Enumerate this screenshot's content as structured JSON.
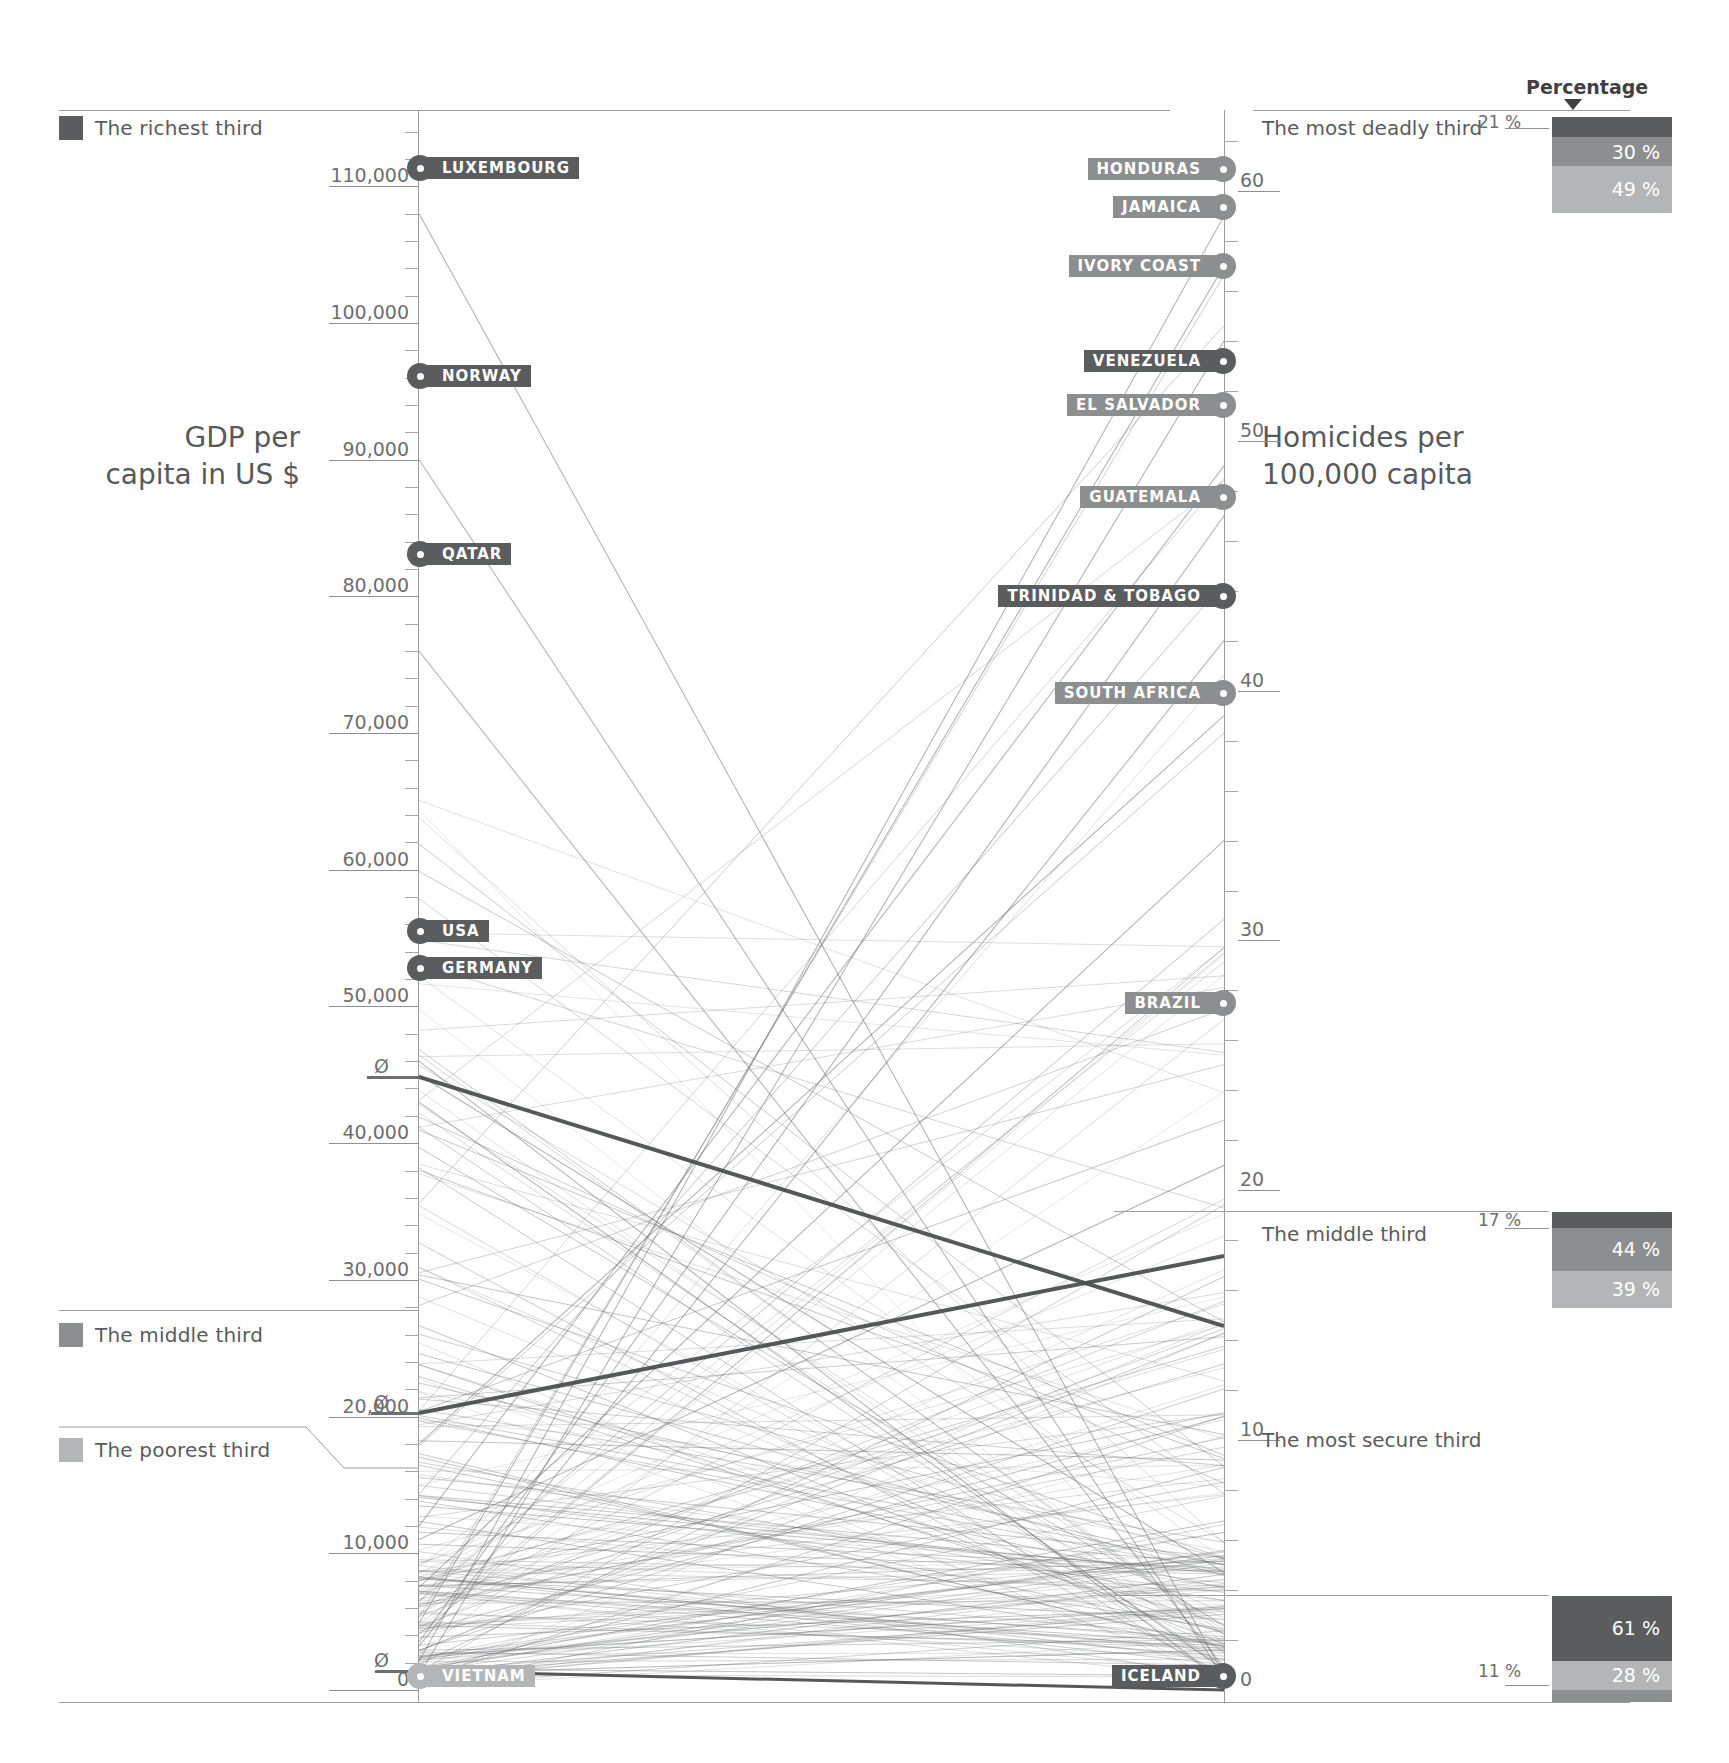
{
  "legend": {
    "items": [
      {
        "name": "richest-third",
        "label": "The richest third",
        "color": "#5b5c5e"
      },
      {
        "name": "middle-third",
        "label": "The middle third",
        "color": "#8d8e90"
      },
      {
        "name": "poorest-third",
        "label": "The poorest third",
        "color": "#b4b5b7"
      }
    ]
  },
  "axes": {
    "left": {
      "title_line1": "GDP per",
      "title_line2": "capita in US $",
      "ticks": [
        "110,000",
        "100,000",
        "90,000",
        "80,000",
        "70,000",
        "60,000",
        "50,000",
        "40,000",
        "30,000",
        "20,000",
        "10,000",
        "0"
      ],
      "avg_marks": [
        "Ø",
        "Ø",
        "Ø"
      ]
    },
    "right": {
      "title_line1": "Homicides per",
      "title_line2": "100,000 capita",
      "ticks": [
        "60",
        "50",
        "40",
        "30",
        "20",
        "10",
        "0"
      ]
    }
  },
  "percentage_header": {
    "label": "Percentage",
    "arrow": "down-triangle"
  },
  "panels": [
    {
      "name": "most-deadly-third",
      "title": "The most deadly third",
      "outside_label": "21 %",
      "segments": [
        {
          "value": "21 %",
          "pct": 21,
          "color": "#5b5c5e",
          "show_label": false
        },
        {
          "value": "30 %",
          "pct": 30,
          "color": "#8d8e90",
          "show_label": true
        },
        {
          "value": "49 %",
          "pct": 49,
          "color": "#b4b5b7",
          "show_label": true
        }
      ]
    },
    {
      "name": "middle-third",
      "title": "The middle third",
      "outside_label": "17 %",
      "segments": [
        {
          "value": "17 %",
          "pct": 17,
          "color": "#5b5c5e",
          "show_label": false
        },
        {
          "value": "44 %",
          "pct": 44,
          "color": "#8d8e90",
          "show_label": true
        },
        {
          "value": "39 %",
          "pct": 39,
          "color": "#b4b5b7",
          "show_label": true
        }
      ]
    },
    {
      "name": "most-secure-third",
      "title": "The most secure third",
      "outside_label": "11 %",
      "segments": [
        {
          "value": "61 %",
          "pct": 61,
          "color": "#5b5c5e",
          "show_label": true
        },
        {
          "value": "28 %",
          "pct": 28,
          "color": "#b4b5b7",
          "show_label": true
        },
        {
          "value": "11 %",
          "pct": 11,
          "color": "#8d8e90",
          "show_label": false
        }
      ]
    }
  ],
  "left_countries": [
    {
      "name": "luxembourg",
      "label": "LUXEMBOURG",
      "tier": "richest",
      "y": 168
    },
    {
      "name": "norway",
      "label": "NORWAY",
      "tier": "richest",
      "y": 376
    },
    {
      "name": "qatar",
      "label": "QATAR",
      "tier": "richest",
      "y": 554
    },
    {
      "name": "usa",
      "label": "USA",
      "tier": "richest",
      "y": 931
    },
    {
      "name": "germany",
      "label": "GERMANY",
      "tier": "richest",
      "y": 968
    },
    {
      "name": "vietnam",
      "label": "VIETNAM",
      "tier": "poorest",
      "y": 1676
    }
  ],
  "right_countries": [
    {
      "name": "honduras",
      "label": "HONDURAS",
      "tier": "middle",
      "y": 169
    },
    {
      "name": "jamaica",
      "label": "JAMAICA",
      "tier": "middle",
      "y": 207
    },
    {
      "name": "ivory-coast",
      "label": "IVORY COAST",
      "tier": "middle",
      "y": 266
    },
    {
      "name": "venezuela",
      "label": "VENEZUELA",
      "tier": "richest",
      "y": 361
    },
    {
      "name": "el-salvador",
      "label": "EL SALVADOR",
      "tier": "middle",
      "y": 405
    },
    {
      "name": "guatemala",
      "label": "GUATEMALA",
      "tier": "middle",
      "y": 497
    },
    {
      "name": "trinidad-tobago",
      "label": "TRINIDAD & TOBAGO",
      "tier": "richest",
      "y": 596
    },
    {
      "name": "south-africa",
      "label": "SOUTH AFRICA",
      "tier": "middle",
      "y": 693
    },
    {
      "name": "brazil",
      "label": "BRAZIL",
      "tier": "middle",
      "y": 1003
    },
    {
      "name": "iceland",
      "label": "ICELAND",
      "tier": "richest",
      "y": 1676
    }
  ],
  "chart_data": {
    "type": "line",
    "subtype": "slopegraph / parallel-coordinates",
    "left_axis": {
      "label": "GDP per capita in US $",
      "ticks": [
        110000,
        100000,
        90000,
        80000,
        70000,
        60000,
        50000,
        40000,
        30000,
        20000,
        10000,
        0
      ],
      "range": [
        0,
        115000
      ],
      "tier_averages": {
        "richest": 33000,
        "middle": 4800,
        "poorest": 1200
      }
    },
    "right_axis": {
      "label": "Homicides per 100,000 capita",
      "ticks": [
        60,
        50,
        40,
        30,
        20,
        10,
        0
      ],
      "range": [
        0,
        63
      ],
      "tier_averages": {
        "richest": 2.5,
        "middle": 9.0,
        "poorest": 13.0
      }
    },
    "grid": false,
    "legend_position": "left",
    "series": [
      {
        "name": "LUXEMBOURG",
        "tier": "richest",
        "gdp": 108000,
        "homicides": 0.6
      },
      {
        "name": "NORWAY",
        "tier": "richest",
        "gdp": 90000,
        "homicides": 0.5
      },
      {
        "name": "QATAR",
        "tier": "richest",
        "gdp": 76000,
        "homicides": 0.9
      },
      {
        "name": "USA",
        "tier": "richest",
        "gdp": 45000,
        "homicides": 4.7
      },
      {
        "name": "GERMANY",
        "tier": "richest",
        "gdp": 43000,
        "homicides": 0.8
      },
      {
        "name": "VIETNAM",
        "tier": "poorest",
        "gdp": 1200,
        "homicides": 1.6
      },
      {
        "name": "HONDURAS",
        "tier": "middle",
        "gdp": 2100,
        "homicides": 59
      },
      {
        "name": "JAMAICA",
        "tier": "middle",
        "gdp": 4900,
        "homicides": 57
      },
      {
        "name": "IVORY COAST",
        "tier": "middle",
        "gdp": 1100,
        "homicides": 54
      },
      {
        "name": "VENEZUELA",
        "tier": "richest",
        "gdp": 12000,
        "homicides": 49
      },
      {
        "name": "EL SALVADOR",
        "tier": "middle",
        "gdp": 3500,
        "homicides": 47
      },
      {
        "name": "GUATEMALA",
        "tier": "middle",
        "gdp": 3200,
        "homicides": 42
      },
      {
        "name": "TRINIDAD & TOBAGO",
        "tier": "richest",
        "gdp": 18000,
        "homicides": 39
      },
      {
        "name": "SOUTH AFRICA",
        "tier": "middle",
        "gdp": 7500,
        "homicides": 34
      },
      {
        "name": "BRAZIL",
        "tier": "middle",
        "gdp": 11000,
        "homicides": 21
      },
      {
        "name": "ICELAND",
        "tier": "richest",
        "gdp": 46000,
        "homicides": 0.3
      }
    ],
    "tier_distribution": {
      "most_deadly_third": {
        "richest": 21,
        "middle": 30,
        "poorest": 49
      },
      "middle_third": {
        "richest": 17,
        "middle": 44,
        "poorest": 39
      },
      "most_secure_third": {
        "richest": 61,
        "middle": 28,
        "poorest": 11
      }
    }
  }
}
